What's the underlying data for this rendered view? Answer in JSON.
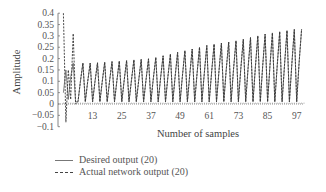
{
  "chart_data": {
    "type": "line",
    "title": "",
    "xlabel": "Number of samples",
    "ylabel": "Amplitude",
    "xlim": [
      1,
      100
    ],
    "ylim": [
      -0.1,
      0.4
    ],
    "x_ticks": [
      13,
      25,
      37,
      49,
      61,
      73,
      85,
      97
    ],
    "y_ticks": [
      -0.1,
      -0.05,
      0,
      0.05,
      0.1,
      0.15,
      0.2,
      0.25,
      0.3,
      0.35,
      0.4
    ],
    "y_tick_labels": [
      "-0.1",
      "-0.05",
      "0",
      "0.05",
      "0.1",
      "0.15",
      "0.2",
      "0.25",
      "0.3",
      "0.35",
      "0.4"
    ],
    "grid": false,
    "legend_position": "bottom-left, below plot",
    "series": [
      {
        "name": "Desired output (20)",
        "style": "solid",
        "peak_envelope": {
          "x": [
            5,
            13,
            25,
            37,
            49,
            61,
            73,
            85,
            97
          ],
          "y": [
            0.18,
            0.18,
            0.19,
            0.2,
            0.23,
            0.26,
            0.28,
            0.31,
            0.33
          ]
        },
        "trough_level": 0.01
      },
      {
        "name": "Actual network output (20)",
        "style": "dashed",
        "initial_spikes": {
          "x": [
            1,
            2,
            3,
            4,
            5,
            6
          ],
          "y": [
            0.4,
            -0.08,
            0.15,
            0.02,
            0.31,
            0.0
          ]
        },
        "peak_envelope": {
          "x": [
            5,
            13,
            25,
            37,
            49,
            61,
            73,
            85,
            97
          ],
          "y": [
            0.31,
            0.18,
            0.19,
            0.2,
            0.23,
            0.26,
            0.28,
            0.31,
            0.33
          ]
        },
        "trough_level": 0.01
      }
    ]
  },
  "legend": {
    "items": [
      {
        "label": "Desired output (20)",
        "style": "solid"
      },
      {
        "label": "Actual network output (20)",
        "style": "dashed"
      }
    ]
  },
  "axes": {
    "xlabel": "Number of samples",
    "ylabel": "Amplitude"
  }
}
